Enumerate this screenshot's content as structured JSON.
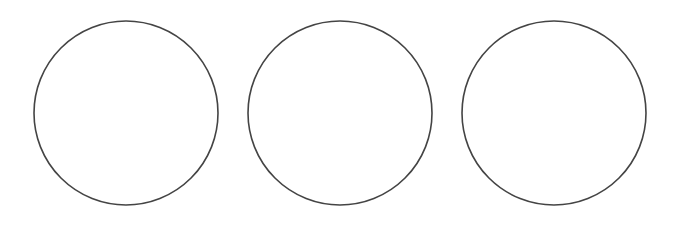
{
  "diagram": {
    "background": "#ffffff",
    "stroke_color": "#444444",
    "stroke_width": 1.6,
    "fill": "none",
    "circles": [
      {
        "cx": 126,
        "cy": 113,
        "r": 92
      },
      {
        "cx": 340,
        "cy": 113,
        "r": 92
      },
      {
        "cx": 554,
        "cy": 113,
        "r": 92
      }
    ]
  }
}
